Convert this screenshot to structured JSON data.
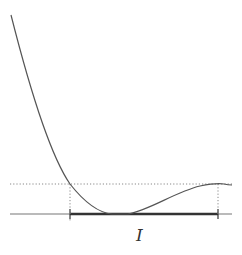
{
  "figure": {
    "interval_label": "I",
    "colors": {
      "curve": "#555555",
      "axis": "#666666",
      "interval": "#333333",
      "dotted": "#888888"
    }
  }
}
